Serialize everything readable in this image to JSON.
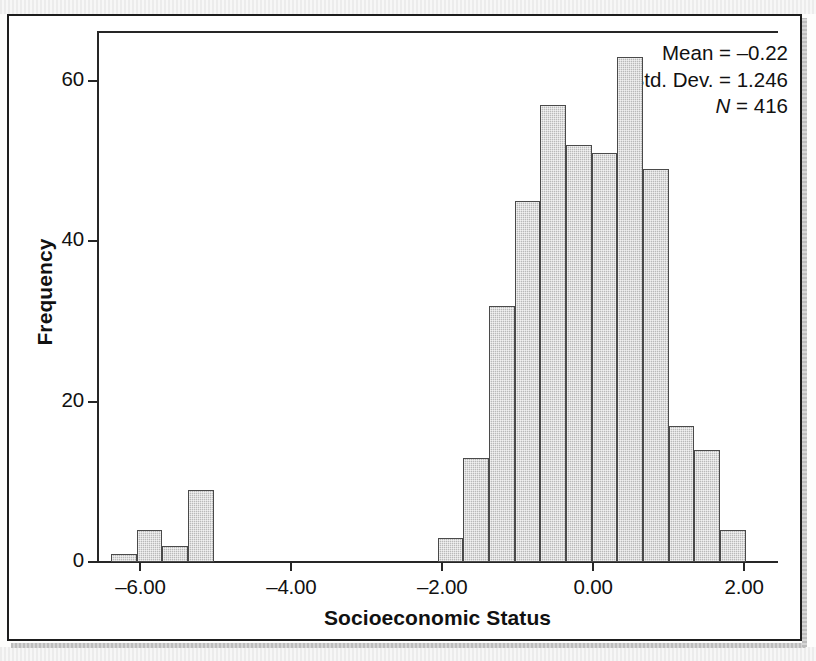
{
  "figure": {
    "kind": "spss-histogram"
  },
  "chart_data": {
    "type": "bar",
    "subtype": "histogram",
    "title": "",
    "xlabel": "Socioeconomic Status",
    "ylabel": "Frequency",
    "xlim": [
      -6.55,
      2.45
    ],
    "ylim": [
      0,
      66
    ],
    "grid": false,
    "legend": null,
    "bin_width": 0.34,
    "xticks": [
      -6.0,
      -4.0,
      -2.0,
      0.0,
      2.0
    ],
    "xticklabels": [
      "–6.00",
      "–4.00",
      "–2.00",
      "0.00",
      "2.00"
    ],
    "yticks": [
      0,
      20,
      40,
      60
    ],
    "yticklabels": [
      "0",
      "20",
      "40",
      "60"
    ],
    "bin_centers": [
      -6.22,
      -5.88,
      -5.54,
      -5.2,
      -1.89,
      -1.55,
      -1.21,
      -0.87,
      -0.53,
      -0.19,
      0.15,
      0.49,
      0.83,
      1.17,
      1.51,
      1.85
    ],
    "values": [
      1,
      4,
      2,
      9,
      3,
      13,
      32,
      45,
      57,
      52,
      51,
      63,
      49,
      17,
      14,
      4
    ],
    "bars": [
      {
        "x": -6.22,
        "value": 1
      },
      {
        "x": -5.88,
        "value": 4
      },
      {
        "x": -5.54,
        "value": 2
      },
      {
        "x": -5.2,
        "value": 9
      },
      {
        "x": -1.89,
        "value": 3
      },
      {
        "x": -1.55,
        "value": 13
      },
      {
        "x": -1.21,
        "value": 32
      },
      {
        "x": -0.87,
        "value": 45
      },
      {
        "x": -0.53,
        "value": 57
      },
      {
        "x": -0.19,
        "value": 52
      },
      {
        "x": 0.15,
        "value": 51
      },
      {
        "x": 0.49,
        "value": 63
      },
      {
        "x": 0.83,
        "value": 49
      },
      {
        "x": 1.17,
        "value": 17
      },
      {
        "x": 1.51,
        "value": 14
      },
      {
        "x": 1.85,
        "value": 4
      }
    ],
    "bar_fill": "#b9b9b9",
    "bar_edge": "#4a4a4a",
    "annotations": {
      "mean_label": "Mean = –0.22",
      "std_label": "Std. Dev. = 1.246",
      "n_symbol": "N",
      "n_value": " = 416"
    },
    "statistics": {
      "mean": -0.22,
      "std_dev": 1.246,
      "n": 416
    }
  }
}
